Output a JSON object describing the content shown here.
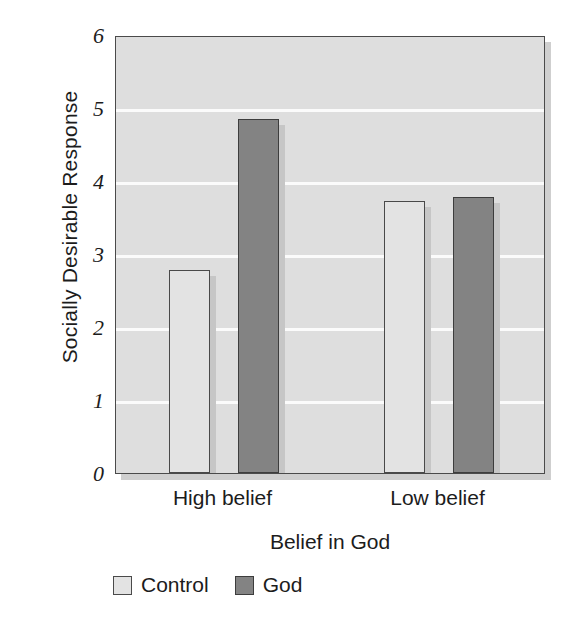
{
  "chart_data": {
    "type": "bar",
    "title": "",
    "subtitle": "",
    "xlabel": "Belief in God",
    "ylabel": "Socially Desirable Response",
    "categories": [
      "High belief",
      "Low belief"
    ],
    "series": [
      {
        "name": "Control",
        "color": "#e3e3e3",
        "values": [
          2.78,
          3.72
        ]
      },
      {
        "name": "God",
        "color": "#838383",
        "values": [
          4.85,
          3.78
        ]
      }
    ],
    "ylim": [
      0,
      6
    ],
    "ytick_labels": [
      "0",
      "1",
      "2",
      "3",
      "4",
      "5",
      "6"
    ],
    "ytick_values": [
      0,
      1,
      2,
      3,
      4,
      5,
      6
    ],
    "grid": "horizontal",
    "gridline_color": "#fbfbfb",
    "plot_background": "#dedede",
    "axis_color": "#4a4a4a",
    "legend_position": "below-left",
    "legend_entries": [
      "Control",
      "God"
    ],
    "annotations": []
  },
  "axes": {
    "y_title": "Socially Desirable Response",
    "x_title": "Belief in God"
  },
  "legend": {
    "items": [
      {
        "label": "Control",
        "swatch": "legend-swatch-control"
      },
      {
        "label": "God",
        "swatch": "legend-swatch-god"
      }
    ]
  }
}
